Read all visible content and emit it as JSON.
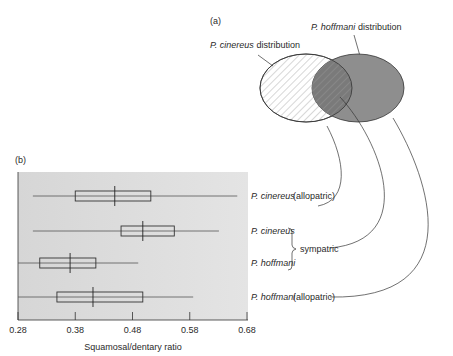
{
  "panel_a": {
    "label": "(a)",
    "cinereus_label_italic": "P. cinereus",
    "cinereus_label_rest": " distribution",
    "hoffmani_label_italic": "P. hoffmani",
    "hoffmani_label_rest": " distribution",
    "colors": {
      "hoffmani_fill": "#8e8e8e",
      "cinereus_hatch": "#9a9a9a",
      "stroke": "#333333"
    }
  },
  "panel_b": {
    "label": "(b)",
    "group_labels": [
      {
        "species": "P. cinereus",
        "note": "(allopatric)"
      },
      {
        "species": "P. cinereus",
        "note": ""
      },
      {
        "species": "P. hoffmani",
        "note": ""
      },
      {
        "species": "P. hoffmani",
        "note": "(allopatric)"
      }
    ],
    "sympatric_label": "sympatric"
  },
  "chart_data": {
    "type": "box",
    "title": "",
    "xlabel": "Squamosal/dentary ratio",
    "ylabel": "",
    "xlim": [
      0.28,
      0.68
    ],
    "xticks": [
      "0.28",
      "0.38",
      "0.48",
      "0.58",
      "0.68"
    ],
    "xtick_values": [
      0.28,
      0.38,
      0.48,
      0.58,
      0.68
    ],
    "grid": false,
    "categories": [
      "P. cinereus (allopatric)",
      "P. cinereus (sympatric)",
      "P. hoffmani (sympatric)",
      "P. hoffmani (allopatric)"
    ],
    "series": [
      {
        "name": "P. cinereus (allopatric)",
        "whisker_low": 0.306,
        "q1": 0.38,
        "median": 0.449,
        "q3": 0.512,
        "whisker_high": 0.663
      },
      {
        "name": "P. cinereus (sympatric)",
        "whisker_low": 0.306,
        "q1": 0.46,
        "median": 0.498,
        "q3": 0.553,
        "whisker_high": 0.631
      },
      {
        "name": "P. hoffmani (sympatric)",
        "whisker_low": 0.28,
        "q1": 0.318,
        "median": 0.371,
        "q3": 0.416,
        "whisker_high": 0.49
      },
      {
        "name": "P. hoffmani (allopatric)",
        "whisker_low": 0.28,
        "q1": 0.348,
        "median": 0.411,
        "q3": 0.498,
        "whisker_high": 0.586
      }
    ]
  }
}
